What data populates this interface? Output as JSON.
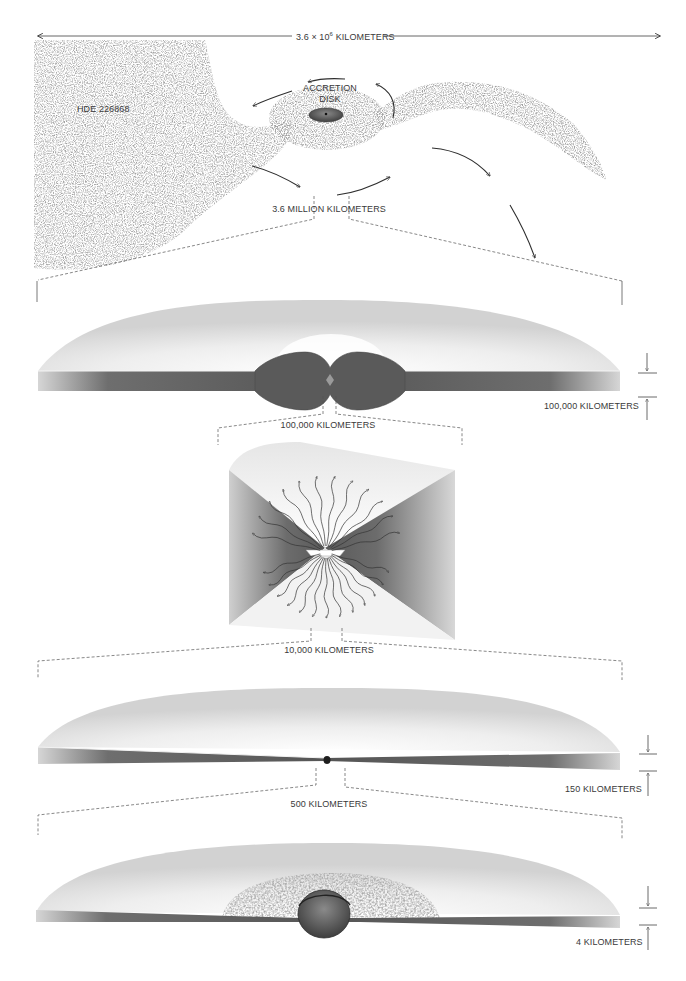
{
  "panel1": {
    "span_label_prefix": "3.6 × 10",
    "span_label_exp": "6",
    "span_label_suffix": " KILOMETERS",
    "star_label": "HDE 226868",
    "disk_label_line1": "ACCRETION",
    "disk_label_line2": "DISK",
    "zoom_label": "3.6 MILLION KILOMETERS"
  },
  "panel2": {
    "thickness_label": "100,000 KILOMETERS",
    "zoom_label": "100,000 KILOMETERS"
  },
  "panel3": {
    "zoom_label": "10,000 KILOMETERS"
  },
  "panel4": {
    "thickness_label": "150 KILOMETERS",
    "zoom_label": "500 KILOMETERS"
  },
  "panel5": {
    "thickness_label": "4 KILOMETERS"
  },
  "colors": {
    "ink": "#3a3a3a",
    "disk_dark": "#5a5a5a",
    "gas": "#7a7a7a",
    "background": "#ffffff"
  }
}
